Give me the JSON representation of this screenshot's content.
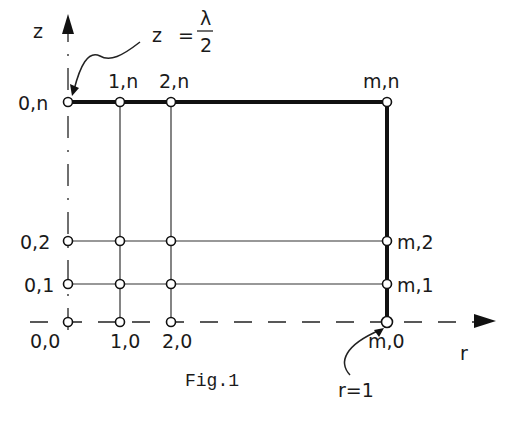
{
  "figure": {
    "caption": "Fig.1",
    "axes": {
      "z_label": "z",
      "r_label": "r"
    },
    "annotations": {
      "top_left": {
        "lhs": "z",
        "eq": "=",
        "numerator": "λ",
        "denominator": "2"
      },
      "bottom_right": "r=1"
    },
    "node_labels": {
      "0n": "0,n",
      "1n": "1,n",
      "2n": "2,n",
      "mn": "m,n",
      "02": "0,2",
      "m2": "m,2",
      "01": "0,1",
      "m1": "m,1",
      "00": "0,0",
      "10": "1,0",
      "20": "2,0",
      "m0": "m,0"
    }
  }
}
